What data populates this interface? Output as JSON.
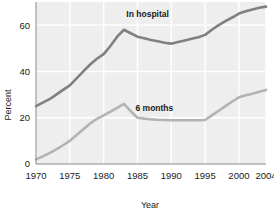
{
  "chart_data": {
    "type": "line",
    "title": "",
    "xlabel": "Year",
    "ylabel": "Percent",
    "xlim": [
      1970,
      2004
    ],
    "ylim": [
      0,
      70
    ],
    "yticks": [
      0,
      20,
      40,
      60
    ],
    "ytick_labels": [
      "0",
      "20",
      "40",
      "60"
    ],
    "xticks": [
      1970,
      1975,
      1980,
      1985,
      1990,
      1995,
      2000,
      2004
    ],
    "xtick_labels": [
      "1970",
      "1975",
      "1980",
      "1985",
      "1990",
      "1995",
      "2000",
      "2004"
    ],
    "grid": true,
    "grid_color": "#ffffff",
    "plot_background": "#eeeeee",
    "legend_position": "inline-labels",
    "series": [
      {
        "name": "In hospital",
        "color": "#808080",
        "label_x": 1986.5,
        "label_y": 63.5,
        "x": [
          1970,
          1971,
          1972,
          1973,
          1974,
          1975,
          1976,
          1977,
          1978,
          1979,
          1980,
          1981,
          1982,
          1983,
          1984,
          1985,
          1986,
          1987,
          1988,
          1989,
          1990,
          1991,
          1992,
          1993,
          1994,
          1995,
          1996,
          1997,
          1998,
          1999,
          2000,
          2001,
          2002,
          2003,
          2004
        ],
        "values": [
          25,
          26.5,
          28,
          30,
          32,
          34,
          37,
          40,
          43,
          45.5,
          47.5,
          51,
          55,
          58,
          56.5,
          55,
          54.3,
          53.6,
          53,
          52.4,
          52,
          52.7,
          53.4,
          54.1,
          54.8,
          55.8,
          58,
          60,
          61.7,
          63.3,
          65,
          66,
          66.8,
          67.5,
          68
        ]
      },
      {
        "name": "6 months",
        "color": "#b3b3b3",
        "label_x": 1987.5,
        "label_y": 23,
        "x": [
          1970,
          1971,
          1972,
          1973,
          1974,
          1975,
          1976,
          1977,
          1978,
          1979,
          1980,
          1981,
          1982,
          1983,
          1984,
          1985,
          1986,
          1987,
          1988,
          1989,
          1990,
          1991,
          1992,
          1993,
          1994,
          1995,
          1996,
          1997,
          1998,
          1999,
          2000,
          2001,
          2002,
          2003,
          2004
        ],
        "values": [
          2,
          3.3,
          4.7,
          6.3,
          8.1,
          10,
          12.5,
          15,
          17.5,
          19.5,
          21,
          22.6,
          24.3,
          26,
          22.8,
          20,
          19.6,
          19.3,
          19.1,
          19,
          18.9,
          18.9,
          18.9,
          18.9,
          18.9,
          19,
          21,
          23,
          25,
          27,
          28.8,
          29.7,
          30.4,
          31.2,
          32
        ]
      }
    ]
  }
}
